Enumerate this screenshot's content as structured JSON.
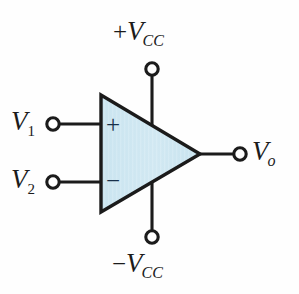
{
  "diagram": {
    "type": "op-amp-symbol",
    "background_color": "#fefefe",
    "body_fill_color": "#cfe7f1",
    "body_stroke_color": "#1b1b1b",
    "wire_color": "#1b1b1b",
    "sign_color": "#17304a"
  },
  "body": {
    "shape": "triangle",
    "plus_sign": "+",
    "minus_sign": "−"
  },
  "terminals": {
    "supply_positive": {
      "label_sign": "+",
      "label_var": "V",
      "label_sub": "CC",
      "position": "top"
    },
    "supply_negative": {
      "label_sign": "−",
      "label_var": "V",
      "label_sub": "CC",
      "position": "bottom"
    },
    "input_noninverting": {
      "label_var": "V",
      "label_sub": "1",
      "position": "left-upper"
    },
    "input_inverting": {
      "label_var": "V",
      "label_sub": "2",
      "position": "left-lower"
    },
    "output": {
      "label_var": "V",
      "label_sub": "o",
      "position": "right"
    }
  }
}
